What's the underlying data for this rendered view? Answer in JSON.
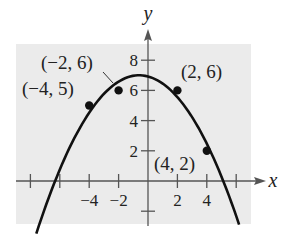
{
  "chart_data": {
    "type": "scatter",
    "title": "",
    "xlabel": "x",
    "ylabel": "y",
    "xlim": [
      -9,
      7
    ],
    "ylim": [
      -3,
      9
    ],
    "grid": false,
    "background_color": "#ebebeb",
    "x_ticks": [
      -8,
      -6,
      -4,
      -2,
      2,
      4,
      6
    ],
    "x_tick_labels": [
      {
        "value": -4,
        "label": "−4"
      },
      {
        "value": -2,
        "label": "−2"
      },
      {
        "value": 2,
        "label": "2"
      },
      {
        "value": 4,
        "label": "4"
      }
    ],
    "y_ticks": [
      -2,
      2,
      4,
      6,
      8
    ],
    "y_tick_labels": [
      {
        "value": 2,
        "label": "2"
      },
      {
        "value": 4,
        "label": "4"
      },
      {
        "value": 6,
        "label": "6"
      },
      {
        "value": 8,
        "label": "8"
      }
    ],
    "points": [
      {
        "x": -4,
        "y": 5,
        "label": "(−4, 5)"
      },
      {
        "x": -2,
        "y": 6,
        "label": "(−2, 6)"
      },
      {
        "x": 2,
        "y": 6,
        "label": "(2, 6)"
      },
      {
        "x": 4,
        "y": 2,
        "label": "(4, 2)"
      }
    ],
    "series": [
      {
        "name": "quadratic model",
        "type": "line",
        "equation": "y = -0.214(x + 0.6)^2 + 7",
        "vertex": [
          -0.6,
          7.0
        ],
        "x_range": [
          -7.6,
          6.2
        ]
      }
    ]
  }
}
